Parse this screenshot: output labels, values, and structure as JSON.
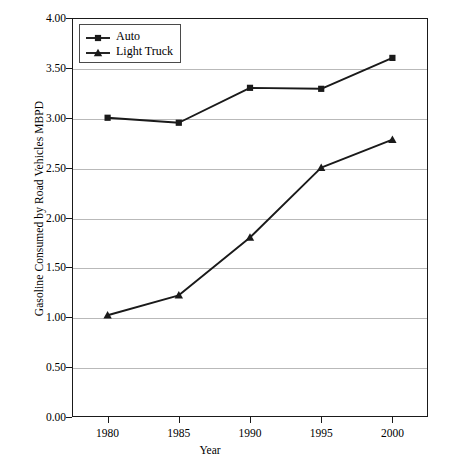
{
  "chart_data": {
    "type": "line",
    "title": "",
    "xlabel": "Year",
    "ylabel": "Gasoline Consumed by Road Vehicles MBPD",
    "x": [
      1980,
      1985,
      1990,
      1995,
      2000
    ],
    "xticklabels": [
      "1980",
      "1985",
      "1990",
      "1995",
      "2000"
    ],
    "xlim": [
      1977.5,
      2002.5
    ],
    "ylim": [
      0.0,
      4.0
    ],
    "yticks": [
      0.0,
      0.5,
      1.0,
      1.5,
      2.0,
      2.5,
      3.0,
      3.5,
      4.0
    ],
    "yticklabels": [
      "0.00",
      "0.50",
      "1.00",
      "1.50",
      "2.00",
      "2.50",
      "3.00",
      "3.50",
      "4.00"
    ],
    "grid": "horizontal",
    "legend_position": "upper-left-inside",
    "series": [
      {
        "name": "Auto",
        "marker": "square",
        "color": "#1a1a1a",
        "values": [
          3.0,
          2.95,
          3.3,
          3.29,
          3.6
        ]
      },
      {
        "name": "Light Truck",
        "marker": "triangle",
        "color": "#1a1a1a",
        "values": [
          1.02,
          1.22,
          1.8,
          2.5,
          2.78
        ]
      }
    ]
  },
  "axes": {
    "y_title": "Gasoline Consumed by Road Vehicles MBPD",
    "x_title": "Year"
  },
  "legend": {
    "entries": [
      {
        "label": "Auto"
      },
      {
        "label": "Light Truck"
      }
    ]
  },
  "style": {
    "axis_color": "#1a1a1a",
    "grid_color": "#b9b9b9",
    "series_color": "#1a1a1a",
    "background": "#ffffff"
  }
}
